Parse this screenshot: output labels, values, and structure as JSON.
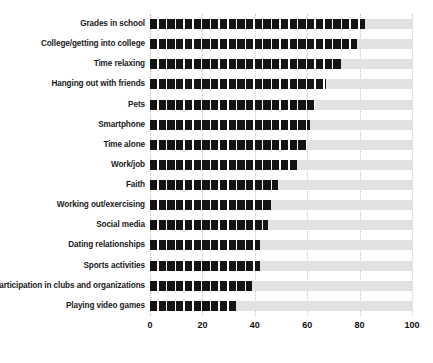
{
  "chart_data": {
    "type": "bar",
    "orientation": "horizontal",
    "title": "",
    "subtitle": "",
    "xlabel": "",
    "ylabel": "",
    "xlim": [
      0,
      100
    ],
    "ylim": null,
    "grid": true,
    "gridlines_axis": "x",
    "legend": null,
    "legend_position": "none",
    "bar_style": "segmented-dashed",
    "colors": {
      "bar": "#141414",
      "track": "#e2e2e2",
      "gridline": "#c8c8c8",
      "text": "#111111",
      "background": "#ffffff"
    },
    "categories": [
      "Grades in school",
      "College/getting into college",
      "Time relaxing",
      "Hanging out with friends",
      "Pets",
      "Smartphone",
      "Time alone",
      "Work/job",
      "Faith",
      "Working out/exercising",
      "Social media",
      "Dating relationships",
      "Sports activities",
      "Participation in clubs and organizations",
      "Playing video games"
    ],
    "values": [
      82,
      79,
      73,
      67,
      63,
      61,
      60,
      56,
      49,
      46,
      45,
      42,
      42,
      39,
      33
    ],
    "xticks": [
      0,
      20,
      40,
      60,
      80,
      100
    ],
    "xticklabels": [
      "0",
      "20",
      "40",
      "60",
      "80",
      "100"
    ]
  }
}
